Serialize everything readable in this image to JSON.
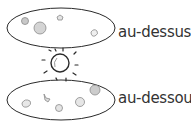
{
  "diagram": {
    "labels": {
      "above": "au-dessus",
      "below": "au-dessous"
    },
    "colors": {
      "stroke": "#2a2a2a",
      "text": "#333333",
      "sketch": "#8a8a8a",
      "background": "#ffffff"
    },
    "regions": [
      {
        "name": "above",
        "shape": "ellipse",
        "contains": "small sketched objects (5)"
      },
      {
        "name": "below",
        "shape": "ellipse",
        "contains": "small sketched objects (5)"
      }
    ],
    "center": {
      "shape": "circle",
      "icon": "sun-icon",
      "rays": 10
    }
  }
}
